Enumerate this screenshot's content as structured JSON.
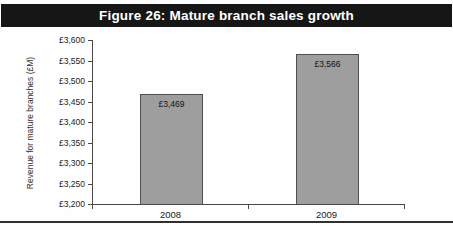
{
  "chart_data": {
    "type": "bar",
    "title": "Figure 26: Mature branch sales growth",
    "categories": [
      "2008",
      "2009"
    ],
    "values": [
      3469,
      3566
    ],
    "data_labels": [
      "£3,469",
      "£3,566"
    ],
    "xlabel": "",
    "ylabel": "Revenue for mature branches (£M)",
    "ylim": [
      3200,
      3600
    ],
    "ytick_step": 50,
    "ytick_labels": [
      "£3,600",
      "£3,550",
      "£3,500",
      "£3,450",
      "£3,400",
      "£3,350",
      "£3,300",
      "£3,250",
      "£3,200"
    ],
    "grid": false,
    "legend_position": "none",
    "colors": {
      "title_bg": "#161616",
      "title_text": "#ffffff",
      "bar_fill": "#9e9e9e",
      "bar_border": "#4f4f4f",
      "axis_line": "#4a4a4a"
    }
  }
}
